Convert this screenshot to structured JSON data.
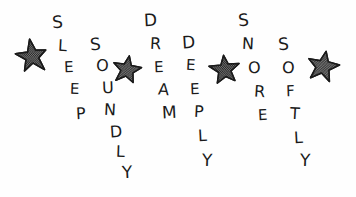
{
  "artwork": {
    "title": "Sleep Soundly Dream Deeply Snore Softly",
    "style": "hand-drawn ink doodle",
    "background_color": "#fefefe",
    "ink_color": "#1a1a1a",
    "star_fill_color": "#222222",
    "width": 356,
    "height": 197,
    "phrase": "SLEEP SOUNDLY DREAM DEEPLY SNORE SOFTLY"
  },
  "words": [
    {
      "name": "sleep",
      "text": "SLEEP",
      "letters": [
        {
          "char": "S",
          "x": 52,
          "y": 14,
          "size": 17,
          "rotate": -4
        },
        {
          "char": "L",
          "x": 58,
          "y": 38,
          "size": 16,
          "rotate": 3
        },
        {
          "char": "E",
          "x": 64,
          "y": 60,
          "size": 15,
          "rotate": -2
        },
        {
          "char": "E",
          "x": 70,
          "y": 82,
          "size": 15,
          "rotate": 2
        },
        {
          "char": "P",
          "x": 76,
          "y": 106,
          "size": 16,
          "rotate": -3
        }
      ]
    },
    {
      "name": "soundly",
      "text": "SOUNDLY",
      "letters": [
        {
          "char": "S",
          "x": 90,
          "y": 36,
          "size": 17,
          "rotate": -5
        },
        {
          "char": "O",
          "x": 96,
          "y": 58,
          "size": 16,
          "rotate": 4
        },
        {
          "char": "U",
          "x": 102,
          "y": 80,
          "size": 16,
          "rotate": -2
        },
        {
          "char": "N",
          "x": 104,
          "y": 102,
          "size": 16,
          "rotate": 3
        },
        {
          "char": "D",
          "x": 110,
          "y": 124,
          "size": 16,
          "rotate": -4
        },
        {
          "char": "L",
          "x": 116,
          "y": 144,
          "size": 16,
          "rotate": 2
        },
        {
          "char": "Y",
          "x": 122,
          "y": 164,
          "size": 17,
          "rotate": -3
        }
      ]
    },
    {
      "name": "dream",
      "text": "DREAM",
      "letters": [
        {
          "char": "D",
          "x": 144,
          "y": 12,
          "size": 17,
          "rotate": -3
        },
        {
          "char": "R",
          "x": 150,
          "y": 36,
          "size": 16,
          "rotate": 3
        },
        {
          "char": "E",
          "x": 154,
          "y": 60,
          "size": 15,
          "rotate": -2
        },
        {
          "char": "A",
          "x": 158,
          "y": 82,
          "size": 16,
          "rotate": 4
        },
        {
          "char": "M",
          "x": 162,
          "y": 104,
          "size": 17,
          "rotate": -3
        }
      ]
    },
    {
      "name": "deeply",
      "text": "DEEPLY",
      "letters": [
        {
          "char": "D",
          "x": 182,
          "y": 34,
          "size": 17,
          "rotate": -4
        },
        {
          "char": "E",
          "x": 186,
          "y": 58,
          "size": 15,
          "rotate": 3
        },
        {
          "char": "E",
          "x": 190,
          "y": 82,
          "size": 15,
          "rotate": -2
        },
        {
          "char": "P",
          "x": 194,
          "y": 104,
          "size": 16,
          "rotate": 3
        },
        {
          "char": "L",
          "x": 198,
          "y": 128,
          "size": 16,
          "rotate": -3
        },
        {
          "char": "Y",
          "x": 202,
          "y": 152,
          "size": 17,
          "rotate": 2
        }
      ]
    },
    {
      "name": "snore",
      "text": "SNORE",
      "letters": [
        {
          "char": "S",
          "x": 238,
          "y": 12,
          "size": 17,
          "rotate": -4
        },
        {
          "char": "N",
          "x": 242,
          "y": 36,
          "size": 16,
          "rotate": 3
        },
        {
          "char": "O",
          "x": 248,
          "y": 60,
          "size": 16,
          "rotate": -2
        },
        {
          "char": "R",
          "x": 254,
          "y": 84,
          "size": 16,
          "rotate": 4
        },
        {
          "char": "E",
          "x": 258,
          "y": 108,
          "size": 15,
          "rotate": -3
        }
      ]
    },
    {
      "name": "softly",
      "text": "SOFTLY",
      "letters": [
        {
          "char": "S",
          "x": 278,
          "y": 36,
          "size": 17,
          "rotate": -4
        },
        {
          "char": "O",
          "x": 282,
          "y": 60,
          "size": 16,
          "rotate": 3
        },
        {
          "char": "F",
          "x": 286,
          "y": 84,
          "size": 15,
          "rotate": -2
        },
        {
          "char": "T",
          "x": 290,
          "y": 106,
          "size": 16,
          "rotate": 3
        },
        {
          "char": "L",
          "x": 294,
          "y": 130,
          "size": 16,
          "rotate": -3
        },
        {
          "char": "Y",
          "x": 300,
          "y": 152,
          "size": 17,
          "rotate": 2
        }
      ]
    }
  ],
  "stars": [
    {
      "name": "star-1",
      "x": 14,
      "y": 38,
      "size": 36,
      "rotate": -8
    },
    {
      "name": "star-2",
      "x": 110,
      "y": 52,
      "size": 34,
      "rotate": 10
    },
    {
      "name": "star-3",
      "x": 208,
      "y": 52,
      "size": 34,
      "rotate": -6
    },
    {
      "name": "star-4",
      "x": 305,
      "y": 48,
      "size": 36,
      "rotate": 12
    }
  ]
}
